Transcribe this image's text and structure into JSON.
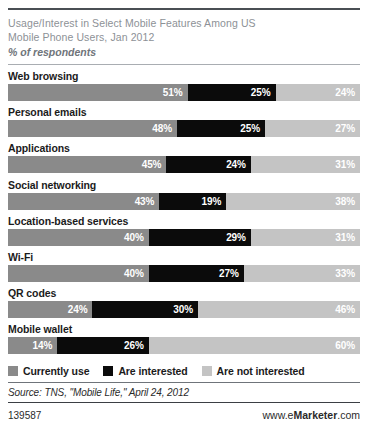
{
  "header": {
    "title_line1": "Usage/Interest in Select Mobile Features Among US",
    "title_line2": "Mobile Phone Users, Jan 2012",
    "subtitle": "% of respondents"
  },
  "legend": {
    "items": [
      {
        "label": "Currently use",
        "color": "#8a8a8a"
      },
      {
        "label": "Are interested",
        "color": "#0b0b0b"
      },
      {
        "label": "Are not interested",
        "color": "#c4c4c4"
      }
    ]
  },
  "source": "Source: TNS, \"Mobile Life,\" April 24, 2012",
  "footer": {
    "id": "139587",
    "brand_prefix": "www.e",
    "brand_bold": "Marketer",
    "brand_suffix": ".com"
  },
  "chart_data": {
    "type": "bar",
    "orientation": "horizontal",
    "stacked": true,
    "stack_total": 100,
    "title": "Usage/Interest in Select Mobile Features Among US Mobile Phone Users, Jan 2012",
    "subtitle": "% of respondents",
    "xlabel": "",
    "ylabel": "",
    "xlim": [
      0,
      100
    ],
    "grid": false,
    "legend_position": "bottom",
    "value_suffix": "%",
    "categories": [
      "Web browsing",
      "Personal emails",
      "Applications",
      "Social networking",
      "Location-based services",
      "Wi-Fi",
      "QR codes",
      "Mobile wallet"
    ],
    "series": [
      {
        "name": "Currently use",
        "color": "#8a8a8a",
        "values": [
          51,
          48,
          45,
          43,
          40,
          40,
          24,
          14
        ]
      },
      {
        "name": "Are interested",
        "color": "#0b0b0b",
        "values": [
          25,
          25,
          24,
          19,
          29,
          27,
          30,
          26
        ]
      },
      {
        "name": "Are not interested",
        "color": "#c4c4c4",
        "values": [
          24,
          27,
          31,
          38,
          31,
          33,
          46,
          60
        ]
      }
    ],
    "rows": [
      {
        "label": "Web browsing",
        "use": "51%",
        "interested": "25%",
        "not_interested": "24%",
        "use_v": 51,
        "int_v": 25,
        "not_v": 24
      },
      {
        "label": "Personal emails",
        "use": "48%",
        "interested": "25%",
        "not_interested": "27%",
        "use_v": 48,
        "int_v": 25,
        "not_v": 27
      },
      {
        "label": "Applications",
        "use": "45%",
        "interested": "24%",
        "not_interested": "31%",
        "use_v": 45,
        "int_v": 24,
        "not_v": 31
      },
      {
        "label": "Social networking",
        "use": "43%",
        "interested": "19%",
        "not_interested": "38%",
        "use_v": 43,
        "int_v": 19,
        "not_v": 38
      },
      {
        "label": "Location-based services",
        "use": "40%",
        "interested": "29%",
        "not_interested": "31%",
        "use_v": 40,
        "int_v": 29,
        "not_v": 31
      },
      {
        "label": "Wi-Fi",
        "use": "40%",
        "interested": "27%",
        "not_interested": "33%",
        "use_v": 40,
        "int_v": 27,
        "not_v": 33
      },
      {
        "label": "QR codes",
        "use": "24%",
        "interested": "30%",
        "not_interested": "46%",
        "use_v": 24,
        "int_v": 30,
        "not_v": 46
      },
      {
        "label": "Mobile wallet",
        "use": "14%",
        "interested": "26%",
        "not_interested": "60%",
        "use_v": 14,
        "int_v": 26,
        "not_v": 60
      }
    ]
  }
}
